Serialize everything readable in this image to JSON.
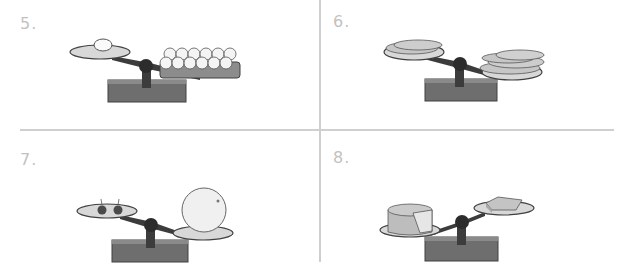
{
  "panels": [
    {
      "number": "5.",
      "left_pan": "1 egg",
      "right_pan": "carton of 12 eggs",
      "heavier_side": "right"
    },
    {
      "number": "6.",
      "left_pan": "2 carrots",
      "right_pan": "4 carrots",
      "heavier_side": "right"
    },
    {
      "number": "7.",
      "left_pan": "2 cherries",
      "right_pan": "ball",
      "heavier_side": "right"
    },
    {
      "number": "8.",
      "left_pan": "cheese wheel",
      "right_pan": "cheese wedge",
      "heavier_side": "left"
    }
  ],
  "colors": {
    "divider": "#cfcfcf",
    "label": "#c2c2c2",
    "base": "#6e6e6e",
    "beam": "#3c3c3c",
    "pan": "#d8d8d8",
    "outline": "#404040"
  }
}
